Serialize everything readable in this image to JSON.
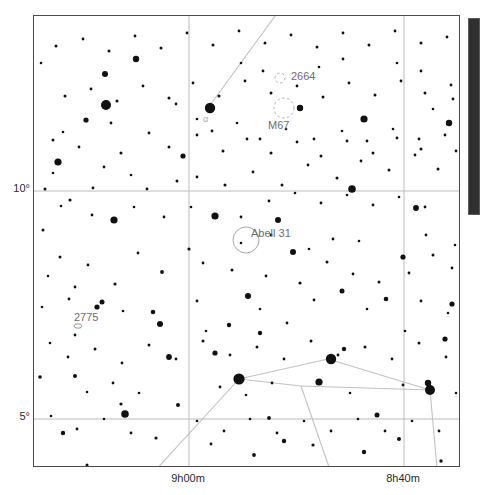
{
  "chart_data": {
    "type": "scatter",
    "title": "",
    "subtitle": "",
    "xlabel": "",
    "ylabel": "",
    "grid": true,
    "legend_position": "none",
    "projection": "equatorial star chart",
    "xlim": [
      "9h10m",
      "8h30m"
    ],
    "ylim": [
      3.2,
      13.6
    ],
    "x_tick_labels": [
      "9h00m",
      "8h40m"
    ],
    "y_tick_labels": [
      "10°",
      "5°"
    ],
    "x_ticks_px": [
      188,
      403
    ],
    "y_ticks_px": [
      190,
      418
    ],
    "frame_px": {
      "left": 33,
      "top": 15,
      "width": 427,
      "height": 452
    },
    "annotations": [
      {
        "label": "2664",
        "type": "open-cluster",
        "symbol_x": 279,
        "symbol_y": 77,
        "text_x": 291,
        "text_y": 77,
        "radius": 5
      },
      {
        "label": "M67",
        "type": "open-cluster",
        "symbol_x": 283,
        "symbol_y": 107,
        "text_x": 268,
        "text_y": 126,
        "radius": 10
      },
      {
        "label": "Abell 31",
        "type": "planetary-nebula",
        "symbol_x": 245,
        "symbol_y": 239,
        "text_x": 251,
        "text_y": 234,
        "radius": 13
      },
      {
        "label": "2775",
        "type": "galaxy",
        "symbol_x": 77,
        "symbol_y": 325,
        "text_x": 74,
        "text_y": 318,
        "radius": 4
      },
      {
        "label": "α",
        "type": "star-designation",
        "symbol_x": 205,
        "symbol_y": 118,
        "text_x": 203,
        "text_y": 121,
        "radius": 0
      }
    ],
    "constellation_lines": [
      [
        [
          285,
          0
        ],
        [
          207,
          107
        ]
      ],
      [
        [
          238,
          378
        ],
        [
          131,
          495
        ]
      ],
      [
        [
          238,
          378
        ],
        [
          300,
          385
        ]
      ],
      [
        [
          300,
          385
        ],
        [
          429,
          389
        ]
      ],
      [
        [
          238,
          378
        ],
        [
          327,
          358
        ]
      ],
      [
        [
          327,
          358
        ],
        [
          429,
          389
        ]
      ],
      [
        [
          429,
          389
        ],
        [
          436,
          467
        ]
      ],
      [
        [
          300,
          385
        ],
        [
          338,
          495
        ]
      ]
    ],
    "stars": [
      [
        105,
        104,
        5.0
      ],
      [
        209,
        107,
        5.2
      ],
      [
        238,
        378,
        5.6
      ],
      [
        330,
        358,
        5.2
      ],
      [
        429,
        389,
        5.0
      ],
      [
        57,
        161,
        3.6
      ],
      [
        113,
        219,
        3.6
      ],
      [
        214,
        215,
        3.6
      ],
      [
        351,
        188,
        3.8
      ],
      [
        124,
        413,
        3.8
      ],
      [
        318,
        381,
        3.6
      ],
      [
        427,
        382,
        3.2
      ],
      [
        363,
        118,
        3.6
      ],
      [
        299,
        107,
        3.2
      ],
      [
        135,
        58,
        3.2
      ],
      [
        292,
        251,
        3.0
      ],
      [
        277,
        219,
        3.0
      ],
      [
        104,
        73,
        3.0
      ],
      [
        85,
        119,
        2.6
      ],
      [
        182,
        155,
        2.6
      ],
      [
        402,
        256,
        2.6
      ],
      [
        448,
        122,
        3.2
      ],
      [
        415,
        207,
        2.9
      ],
      [
        159,
        323,
        3.0
      ],
      [
        247,
        295,
        3.0
      ],
      [
        214,
        352,
        2.6
      ],
      [
        96,
        306,
        2.6
      ],
      [
        101,
        301,
        2.5
      ],
      [
        152,
        311,
        2.3
      ],
      [
        168,
        356,
        2.9
      ],
      [
        341,
        290,
        2.5
      ],
      [
        376,
        414,
        2.5
      ],
      [
        451,
        303,
        2.6
      ],
      [
        228,
        324,
        2.2
      ],
      [
        259,
        332,
        2.2
      ],
      [
        385,
        298,
        2.3
      ],
      [
        444,
        338,
        2.6
      ],
      [
        343,
        348,
        2.2
      ],
      [
        62,
        432,
        2.2
      ],
      [
        177,
        404,
        2.0
      ],
      [
        283,
        440,
        2.2
      ],
      [
        363,
        451,
        2.2
      ],
      [
        398,
        438,
        2.0
      ],
      [
        320,
        467,
        1.6
      ],
      [
        253,
        454,
        1.9
      ],
      [
        440,
        460,
        1.7
      ],
      [
        312,
        444,
        1.6
      ],
      [
        210,
        443,
        1.4
      ],
      [
        268,
        417,
        1.9
      ],
      [
        155,
        437,
        1.6
      ],
      [
        74,
        375,
        2.0
      ],
      [
        120,
        403,
        1.6
      ],
      [
        39,
        376,
        1.8
      ],
      [
        48,
        470,
        1.4
      ],
      [
        86,
        464,
        1.5
      ],
      [
        161,
        271,
        1.9
      ],
      [
        188,
        248,
        1.6
      ],
      [
        202,
        262,
        1.4
      ],
      [
        231,
        269,
        1.5
      ],
      [
        265,
        275,
        1.4
      ],
      [
        299,
        282,
        1.6
      ],
      [
        326,
        261,
        1.5
      ],
      [
        352,
        273,
        1.4
      ],
      [
        378,
        281,
        1.5
      ],
      [
        408,
        272,
        1.4
      ],
      [
        432,
        254,
        1.5
      ],
      [
        451,
        267,
        1.4
      ],
      [
        59,
        256,
        1.5
      ],
      [
        87,
        264,
        1.4
      ],
      [
        114,
        283,
        1.6
      ],
      [
        137,
        252,
        1.4
      ],
      [
        42,
        229,
        1.5
      ],
      [
        69,
        199,
        1.6
      ],
      [
        92,
        187,
        1.4
      ],
      [
        44,
        188,
        1.5
      ],
      [
        146,
        188,
        1.4
      ],
      [
        176,
        180,
        1.5
      ],
      [
        196,
        176,
        1.4
      ],
      [
        224,
        184,
        1.5
      ],
      [
        252,
        171,
        1.4
      ],
      [
        281,
        184,
        1.5
      ],
      [
        307,
        164,
        1.4
      ],
      [
        336,
        177,
        1.5
      ],
      [
        360,
        160,
        1.4
      ],
      [
        388,
        169,
        1.5
      ],
      [
        414,
        154,
        1.4
      ],
      [
        437,
        168,
        1.5
      ],
      [
        455,
        150,
        1.4
      ],
      [
        52,
        139,
        1.5
      ],
      [
        78,
        146,
        1.4
      ],
      [
        120,
        152,
        1.5
      ],
      [
        148,
        132,
        1.4
      ],
      [
        168,
        146,
        1.5
      ],
      [
        196,
        134,
        1.4
      ],
      [
        222,
        150,
        1.5
      ],
      [
        246,
        138,
        1.4
      ],
      [
        270,
        152,
        1.5
      ],
      [
        296,
        141,
        1.4
      ],
      [
        320,
        155,
        1.5
      ],
      [
        346,
        140,
        1.4
      ],
      [
        372,
        152,
        1.5
      ],
      [
        396,
        137,
        1.4
      ],
      [
        420,
        148,
        1.5
      ],
      [
        444,
        134,
        1.4
      ],
      [
        64,
        95,
        1.5
      ],
      [
        90,
        88,
        1.4
      ],
      [
        116,
        100,
        1.5
      ],
      [
        142,
        85,
        1.4
      ],
      [
        168,
        97,
        1.5
      ],
      [
        192,
        82,
        1.4
      ],
      [
        218,
        95,
        1.5
      ],
      [
        244,
        80,
        1.4
      ],
      [
        270,
        92,
        1.5
      ],
      [
        296,
        85,
        1.4
      ],
      [
        322,
        96,
        1.5
      ],
      [
        348,
        82,
        1.4
      ],
      [
        374,
        94,
        1.5
      ],
      [
        400,
        80,
        1.4
      ],
      [
        424,
        92,
        1.5
      ],
      [
        450,
        84,
        1.4
      ],
      [
        55,
        45,
        1.5
      ],
      [
        82,
        38,
        1.4
      ],
      [
        108,
        50,
        1.5
      ],
      [
        134,
        35,
        1.4
      ],
      [
        160,
        47,
        1.5
      ],
      [
        186,
        32,
        1.4
      ],
      [
        212,
        44,
        1.5
      ],
      [
        238,
        30,
        1.4
      ],
      [
        264,
        42,
        1.5
      ],
      [
        290,
        34,
        1.4
      ],
      [
        316,
        46,
        1.5
      ],
      [
        342,
        32,
        1.4
      ],
      [
        368,
        44,
        1.5
      ],
      [
        394,
        30,
        1.4
      ],
      [
        420,
        42,
        1.5
      ],
      [
        446,
        36,
        1.4
      ],
      [
        67,
        356,
        1.4
      ],
      [
        94,
        348,
        1.5
      ],
      [
        121,
        362,
        1.4
      ],
      [
        148,
        344,
        1.5
      ],
      [
        175,
        358,
        1.4
      ],
      [
        202,
        340,
        1.5
      ],
      [
        229,
        354,
        1.4
      ],
      [
        256,
        346,
        1.5
      ],
      [
        283,
        358,
        1.4
      ],
      [
        310,
        340,
        1.5
      ],
      [
        337,
        354,
        1.4
      ],
      [
        364,
        346,
        1.5
      ],
      [
        391,
        358,
        1.4
      ],
      [
        418,
        342,
        1.5
      ],
      [
        445,
        356,
        1.4
      ],
      [
        50,
        415,
        1.3
      ],
      [
        76,
        428,
        1.4
      ],
      [
        103,
        418,
        1.3
      ],
      [
        130,
        432,
        1.4
      ],
      [
        196,
        420,
        1.3
      ],
      [
        223,
        430,
        1.4
      ],
      [
        249,
        418,
        1.3
      ],
      [
        276,
        432,
        1.4
      ],
      [
        303,
        420,
        1.3
      ],
      [
        330,
        430,
        1.4
      ],
      [
        357,
        418,
        1.3
      ],
      [
        384,
        430,
        1.4
      ],
      [
        411,
        420,
        1.3
      ],
      [
        438,
        430,
        1.4
      ],
      [
        41,
        306,
        1.3
      ],
      [
        68,
        298,
        1.4
      ],
      [
        122,
        310,
        1.3
      ],
      [
        196,
        300,
        1.4
      ],
      [
        259,
        308,
        1.3
      ],
      [
        313,
        299,
        1.4
      ],
      [
        366,
        308,
        1.3
      ],
      [
        420,
        300,
        1.4
      ],
      [
        447,
        312,
        1.3
      ],
      [
        40,
        62,
        1.3
      ],
      [
        240,
        62,
        1.3
      ],
      [
        262,
        70,
        1.4
      ],
      [
        318,
        66,
        1.3
      ],
      [
        342,
        58,
        1.4
      ],
      [
        396,
        62,
        1.3
      ],
      [
        420,
        70,
        1.4
      ],
      [
        211,
        130,
        1.4
      ],
      [
        236,
        122,
        1.3
      ],
      [
        259,
        138,
        1.4
      ],
      [
        285,
        128,
        1.3
      ],
      [
        313,
        138,
        1.4
      ],
      [
        341,
        130,
        1.3
      ],
      [
        366,
        140,
        1.4
      ],
      [
        392,
        128,
        1.3
      ],
      [
        418,
        138,
        1.4
      ],
      [
        52,
        172,
        1.3
      ],
      [
        103,
        166,
        1.4
      ],
      [
        130,
        174,
        1.3
      ],
      [
        268,
        200,
        1.4
      ],
      [
        294,
        192,
        1.3
      ],
      [
        320,
        202,
        1.4
      ],
      [
        346,
        194,
        1.3
      ],
      [
        372,
        204,
        1.4
      ],
      [
        398,
        196,
        1.3
      ],
      [
        424,
        206,
        1.4
      ],
      [
        49,
        342,
        1.3
      ],
      [
        74,
        334,
        1.4
      ],
      [
        205,
        330,
        1.3
      ],
      [
        286,
        322,
        1.4
      ],
      [
        404,
        330,
        1.3
      ],
      [
        86,
        391,
        1.3
      ],
      [
        112,
        382,
        1.4
      ],
      [
        138,
        392,
        1.3
      ],
      [
        219,
        386,
        1.4
      ],
      [
        245,
        394,
        1.3
      ],
      [
        271,
        382,
        1.4
      ],
      [
        349,
        392,
        1.3
      ],
      [
        402,
        384,
        1.4
      ],
      [
        455,
        392,
        1.3
      ],
      [
        60,
        205,
        1.3
      ],
      [
        91,
        214,
        1.4
      ],
      [
        133,
        206,
        1.3
      ],
      [
        163,
        216,
        1.4
      ],
      [
        190,
        206,
        1.3
      ],
      [
        240,
        216,
        1.4
      ],
      [
        47,
        275,
        1.3
      ],
      [
        74,
        286,
        1.4
      ],
      [
        240,
        242,
        1.3
      ],
      [
        270,
        234,
        1.4
      ],
      [
        358,
        240,
        1.3
      ],
      [
        425,
        234,
        1.4
      ],
      [
        454,
        244,
        1.3
      ],
      [
        62,
        131,
        1.3
      ],
      [
        110,
        122,
        1.4
      ],
      [
        432,
        108,
        1.3
      ],
      [
        452,
        98,
        1.4
      ],
      [
        196,
        118,
        1.3
      ],
      [
        175,
        103,
        1.4
      ],
      [
        308,
        248,
        1.3
      ],
      [
        332,
        238,
        1.4
      ]
    ]
  },
  "scrollbar": {
    "orientation": "vertical",
    "thumb_top_px": 18,
    "thumb_height_px": 197
  }
}
